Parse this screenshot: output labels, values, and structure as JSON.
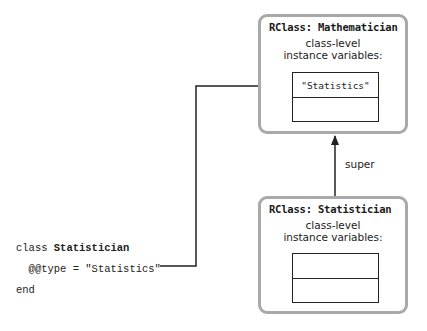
{
  "diagram": {
    "type": "class-hierarchy",
    "nodes": {
      "mathematician": {
        "title": "RClass: Mathematician",
        "ivar_label_line1": "class-level",
        "ivar_label_line2": "instance variables:",
        "ivar_rows": [
          "\"Statistics\"",
          ""
        ]
      },
      "statistician": {
        "title": "RClass: Statistician",
        "ivar_label_line1": "class-level",
        "ivar_label_line2": "instance variables:",
        "ivar_rows": [
          "",
          ""
        ]
      }
    },
    "edges": [
      {
        "from": "statistician",
        "to": "mathematician",
        "label": "super"
      },
      {
        "from": "code.line2",
        "to": "mathematician.ivar_rows.0",
        "label": ""
      }
    ],
    "code": {
      "line1_keyword": "class ",
      "line1_name": "Statistician",
      "line2": "  @@type = \"Statistics\"",
      "line3": "end"
    },
    "super_label": "super",
    "colors": {
      "box_border": "#a9a9a9",
      "line": "#222222",
      "text": "#222222"
    }
  }
}
